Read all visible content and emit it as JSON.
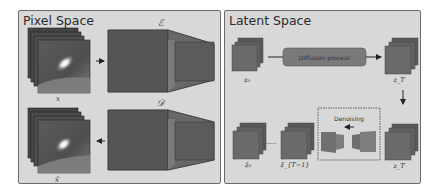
{
  "pixel_space": {
    "title": "Pixel Space",
    "input_label": "x",
    "output_label": "x̃",
    "encoder_label": "ℰ",
    "decoder_label": "𝒟"
  },
  "latent_space": {
    "title": "Latent Space",
    "z0_label": "z₀",
    "zT_label_top": "z_T",
    "zT_label_bottom": "z_T",
    "diffusion_label": "Diffusion process",
    "denoising_label": "Denoising",
    "zhat0_label": "ẑ₀",
    "zhatT1_label": "ẑ_{T−1}",
    "ellipsis": "....."
  },
  "colors": {
    "panel_bg": "#d8d8d8",
    "panel_border": "#6b6b6b",
    "block_dark": "#555555",
    "block_mid": "#6e6e6e",
    "latent_front": "#6a6a6a",
    "latent_back": "#5a5a5a",
    "diffusion_box": "#7a7a7a"
  }
}
